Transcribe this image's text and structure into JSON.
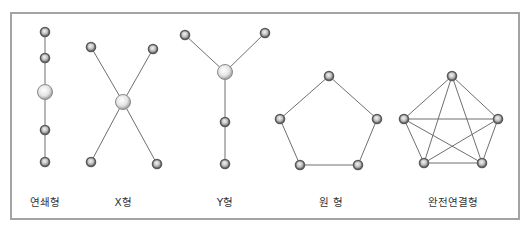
{
  "frame": {
    "x": 11,
    "y": 13,
    "width": 508,
    "height": 206,
    "color": "#a3a3a3"
  },
  "colors": {
    "edge": "#6f6f6f",
    "node_ring": "#5a5a5a",
    "node_fill": "#e6e6e6",
    "hub_fill": "#f2f2f2",
    "label": "#333333"
  },
  "diagrams": [
    {
      "id": "chain",
      "label": "연쇄형",
      "label_pos": [
        45,
        206
      ],
      "nodes": [
        {
          "x": 45,
          "y": 32,
          "r": 4.5
        },
        {
          "x": 45,
          "y": 58,
          "r": 4.5
        },
        {
          "x": 45,
          "y": 92,
          "r": 7.5,
          "hub": true
        },
        {
          "x": 45,
          "y": 130,
          "r": 4.5
        },
        {
          "x": 45,
          "y": 162,
          "r": 4.5
        }
      ],
      "edges": [
        [
          0,
          1
        ],
        [
          1,
          2
        ],
        [
          2,
          3
        ],
        [
          3,
          4
        ]
      ]
    },
    {
      "id": "x",
      "label": "X형",
      "label_pos": [
        123,
        206
      ],
      "nodes": [
        {
          "x": 91,
          "y": 47,
          "r": 4.5
        },
        {
          "x": 153,
          "y": 49,
          "r": 4.5
        },
        {
          "x": 123,
          "y": 102,
          "r": 7.5,
          "hub": true
        },
        {
          "x": 91,
          "y": 162,
          "r": 4.5
        },
        {
          "x": 157,
          "y": 164,
          "r": 4.5
        }
      ],
      "edges": [
        [
          0,
          2
        ],
        [
          1,
          2
        ],
        [
          2,
          3
        ],
        [
          2,
          4
        ]
      ]
    },
    {
      "id": "y",
      "label": "Y형",
      "label_pos": [
        225,
        206
      ],
      "nodes": [
        {
          "x": 185,
          "y": 35,
          "r": 4.5
        },
        {
          "x": 265,
          "y": 33,
          "r": 4.5
        },
        {
          "x": 225,
          "y": 72,
          "r": 7.5,
          "hub": true
        },
        {
          "x": 225,
          "y": 122,
          "r": 4.5
        },
        {
          "x": 225,
          "y": 164,
          "r": 4.5
        }
      ],
      "edges": [
        [
          0,
          2
        ],
        [
          1,
          2
        ],
        [
          2,
          3
        ],
        [
          3,
          4
        ]
      ]
    },
    {
      "id": "ring",
      "label": "원 형",
      "label_pos": [
        331,
        206
      ],
      "nodes": [
        {
          "x": 329,
          "y": 76,
          "r": 4.5
        },
        {
          "x": 377,
          "y": 119,
          "r": 4.5
        },
        {
          "x": 358,
          "y": 165,
          "r": 4.5
        },
        {
          "x": 300,
          "y": 165,
          "r": 4.5
        },
        {
          "x": 280,
          "y": 119,
          "r": 4.5
        }
      ],
      "edges": [
        [
          0,
          1
        ],
        [
          1,
          2
        ],
        [
          2,
          3
        ],
        [
          3,
          4
        ],
        [
          4,
          0
        ]
      ]
    },
    {
      "id": "full",
      "label": "완전연결형",
      "label_pos": [
        453,
        206
      ],
      "nodes": [
        {
          "x": 452,
          "y": 76,
          "r": 4.5
        },
        {
          "x": 498,
          "y": 119,
          "r": 4.5
        },
        {
          "x": 482,
          "y": 163,
          "r": 4.5
        },
        {
          "x": 424,
          "y": 163,
          "r": 4.5
        },
        {
          "x": 404,
          "y": 119,
          "r": 4.5
        }
      ],
      "edges": [
        [
          0,
          1
        ],
        [
          0,
          2
        ],
        [
          0,
          3
        ],
        [
          0,
          4
        ],
        [
          1,
          2
        ],
        [
          1,
          3
        ],
        [
          1,
          4
        ],
        [
          2,
          3
        ],
        [
          2,
          4
        ],
        [
          3,
          4
        ]
      ]
    }
  ]
}
